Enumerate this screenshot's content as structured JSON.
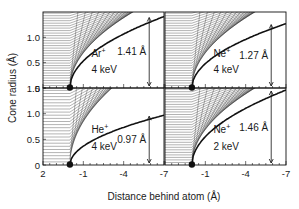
{
  "chart_data": {
    "type": "line",
    "title": "",
    "xlabel": "Distance behind atom (Å)",
    "ylabel": "Cone radius (Å)",
    "grid": false,
    "panels": [
      {
        "id": "ar",
        "position": "top-left",
        "ion": "Ar",
        "charge": "+",
        "energy": "4 keV",
        "cone_radius_label": "1.41 Å",
        "cone_radius": 1.41,
        "xlim": [
          2,
          -7
        ],
        "ylim": [
          0,
          1.5
        ],
        "yticks": [
          "0",
          "0.5",
          "1.0"
        ],
        "xticks": []
      },
      {
        "id": "ne4",
        "position": "top-right",
        "ion": "Ne",
        "charge": "+",
        "energy": "4 keV",
        "cone_radius_label": "1.27 Å",
        "cone_radius": 1.27,
        "xlim": [
          2,
          -7
        ],
        "ylim": [
          0,
          1.5
        ],
        "yticks": [],
        "xticks": []
      },
      {
        "id": "he",
        "position": "bottom-left",
        "ion": "He",
        "charge": "+",
        "energy": "4 keV",
        "cone_radius_label": "0.97 Å",
        "cone_radius": 0.97,
        "xlim": [
          2,
          -7
        ],
        "ylim": [
          0,
          1.5
        ],
        "yticks": [
          "0",
          "0.5",
          "1.0",
          "1.5"
        ],
        "xticks": [
          "2",
          "-1",
          "-4",
          "-7"
        ]
      },
      {
        "id": "ne2",
        "position": "bottom-right",
        "ion": "Ne",
        "charge": "+",
        "energy": "2 keV",
        "cone_radius_label": "1.46 Å",
        "cone_radius": 1.46,
        "xlim": [
          2,
          -7
        ],
        "ylim": [
          0,
          1.5
        ],
        "yticks": [],
        "xticks": [
          "-1",
          "-4",
          "-7"
        ]
      }
    ]
  }
}
